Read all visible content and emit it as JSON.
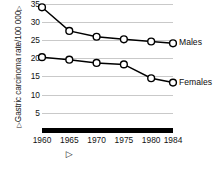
{
  "chart_data": {
    "type": "line",
    "title": "",
    "xlabel": "",
    "ylabel": "Gastric carcinoma rate/100 000",
    "ylabel_prefix_marker": "▷",
    "ylabel_suffix_marker": "▷",
    "x_axis_marker": "▷",
    "x": [
      1960,
      1965,
      1970,
      1975,
      1980,
      1984
    ],
    "categories": [
      "1960",
      "1965",
      "1970",
      "1975",
      "1980",
      "1984"
    ],
    "xlim": [
      1960,
      1984
    ],
    "ylim": [
      0,
      36
    ],
    "yticks": [
      5,
      10,
      15,
      20,
      25,
      30,
      35
    ],
    "ytick_labels": [
      "5",
      "10",
      "15",
      "20",
      "25",
      "30",
      "35"
    ],
    "grid": true,
    "grid_axis": "y",
    "grid_color": "#c9c9c9",
    "legend_position": "right-inline",
    "marker": "open-circle",
    "line_color": "#000000",
    "marker_face_color": "#ffffff",
    "series": [
      {
        "name": "Males",
        "label": "Males",
        "values": [
          34.0,
          27.5,
          25.9,
          25.2,
          24.6,
          24.1
        ]
      },
      {
        "name": "Females",
        "label": "Females",
        "values": [
          20.3,
          19.6,
          18.7,
          18.3,
          14.5,
          13.3
        ]
      }
    ]
  }
}
